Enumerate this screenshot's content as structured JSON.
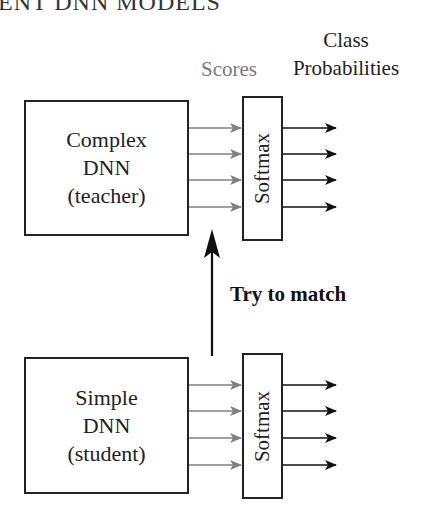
{
  "page": {
    "header_fragment": "ENT DNN MODELS"
  },
  "diagram": {
    "labels": {
      "scores": "Scores",
      "class_line1": "Class",
      "class_line2": "Probabilities",
      "try_to_match": "Try to match"
    },
    "teacher": {
      "line1": "Complex",
      "line2": "DNN",
      "line3": "(teacher)",
      "softmax_label": "Softmax",
      "score_arrow_count": 4,
      "output_arrow_count": 4
    },
    "student": {
      "line1": "Simple",
      "line2": "DNN",
      "line3": "(student)",
      "softmax_label": "Softmax",
      "score_arrow_count": 4,
      "output_arrow_count": 4
    },
    "colors": {
      "score_arrows": "#808080",
      "output_arrows": "#111111",
      "box_border": "#222222",
      "scores_label": "#7a7a7a"
    }
  }
}
